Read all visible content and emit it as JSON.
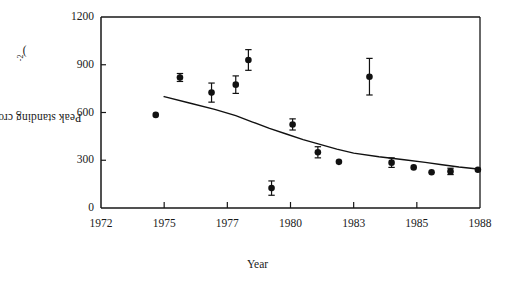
{
  "chart_data": {
    "type": "scatter",
    "title": "",
    "xlabel": "Year",
    "ylabel": "Peak standing crop (g m",
    "ylabel_sup": "-2",
    "ylabel_tail": ")",
    "ylabel_plain": "Peak standing crop (g m-2)",
    "xlim": [
      1972,
      1988
    ],
    "ylim": [
      0,
      1200
    ],
    "xticks": [
      1972,
      1975,
      1977,
      1980,
      1983,
      1985,
      1988
    ],
    "xtick_labels": [
      "1972",
      "1975",
      "1977",
      "1980",
      "1983",
      "1985",
      "1988"
    ],
    "yticks": [
      0,
      300,
      600,
      900,
      1200
    ],
    "ytick_labels": [
      "0",
      "300",
      "600",
      "900",
      "1200"
    ],
    "grid": false,
    "legend": "none",
    "marker_color": "#111111",
    "line_color": "#111111",
    "series": [
      {
        "name": "Peak standing crop",
        "points": [
          {
            "x": 1974.6,
            "y": 585,
            "err": 0
          },
          {
            "x": 1975.5,
            "y": 820,
            "err": 25
          },
          {
            "x": 1976.5,
            "y": 725,
            "err": 60
          },
          {
            "x": 1977.4,
            "y": 775,
            "err": 55
          },
          {
            "x": 1978.0,
            "y": 930,
            "err": 65
          },
          {
            "x": 1979.1,
            "y": 125,
            "err": 45
          },
          {
            "x": 1980.1,
            "y": 525,
            "err": 35
          },
          {
            "x": 1981.3,
            "y": 350,
            "err": 35
          },
          {
            "x": 1982.3,
            "y": 290,
            "err": 0
          },
          {
            "x": 1983.5,
            "y": 825,
            "err": 115
          },
          {
            "x": 1984.2,
            "y": 285,
            "err": 30
          },
          {
            "x": 1984.9,
            "y": 255,
            "err": 0
          },
          {
            "x": 1985.7,
            "y": 225,
            "err": 0
          },
          {
            "x": 1986.6,
            "y": 230,
            "err": 20
          },
          {
            "x": 1987.9,
            "y": 240,
            "err": 0
          }
        ]
      }
    ],
    "fit_curve": {
      "name": "fitted decline curve",
      "points": [
        {
          "x": 1975.0,
          "y": 700
        },
        {
          "x": 1975.8,
          "y": 660
        },
        {
          "x": 1976.6,
          "y": 620
        },
        {
          "x": 1977.4,
          "y": 580
        },
        {
          "x": 1978.2,
          "y": 540
        },
        {
          "x": 1979.0,
          "y": 500
        },
        {
          "x": 1979.8,
          "y": 465
        },
        {
          "x": 1980.6,
          "y": 430
        },
        {
          "x": 1981.4,
          "y": 400
        },
        {
          "x": 1982.2,
          "y": 370
        },
        {
          "x": 1983.0,
          "y": 345
        },
        {
          "x": 1983.8,
          "y": 322
        },
        {
          "x": 1984.6,
          "y": 303
        },
        {
          "x": 1985.4,
          "y": 287
        },
        {
          "x": 1986.2,
          "y": 272
        },
        {
          "x": 1987.0,
          "y": 258
        },
        {
          "x": 1987.9,
          "y": 245
        }
      ]
    }
  }
}
